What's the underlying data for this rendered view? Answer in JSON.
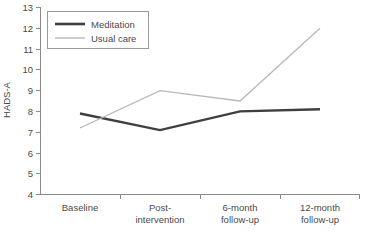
{
  "chart_data": {
    "type": "line",
    "title": "",
    "xlabel": "",
    "ylabel": "HADS-A",
    "ylim": [
      4,
      13
    ],
    "yticks": [
      "4",
      "5",
      "6",
      "7",
      "8",
      "9",
      "10",
      "11",
      "12",
      "13"
    ],
    "grid": false,
    "legend_position": "top-left",
    "categories": [
      "Baseline",
      "Post-\nintervention",
      "6-month\nfollow-up",
      "12-month\nfollow-up"
    ],
    "category_lines": [
      [
        "Baseline"
      ],
      [
        "Post-",
        "intervention"
      ],
      [
        "6-month",
        "follow-up"
      ],
      [
        "12-month",
        "follow-up"
      ]
    ],
    "series": [
      {
        "name": "Meditation",
        "values": [
          7.9,
          7.1,
          8.0,
          8.1
        ],
        "color": "#3f3f3f",
        "width": 2.4
      },
      {
        "name": "Usual care",
        "values": [
          7.2,
          9.0,
          8.5,
          12.0
        ],
        "color": "#b8b8b8",
        "width": 1.3
      }
    ]
  },
  "legend": {
    "entries": [
      {
        "label": "Meditation"
      },
      {
        "label": "Usual care"
      }
    ]
  },
  "axis": {
    "y_title": "HADS-A"
  },
  "colors": {
    "meditation": "#3f3f3f",
    "usual_care": "#b8b8b8",
    "axis": "#8a8a8a",
    "text": "#4a4a4a",
    "legend_border": "#9a9a9a",
    "background": "#ffffff"
  }
}
